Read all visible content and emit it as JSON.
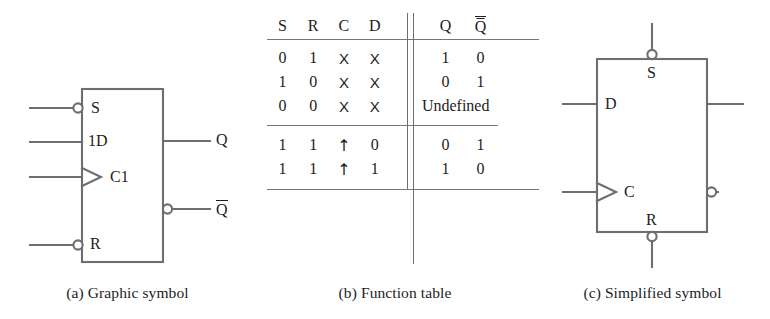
{
  "figure": {
    "stroke_color": "#6e6e6e",
    "text_color": "#1d1d1d",
    "background": "#ffffff"
  },
  "panel_a": {
    "caption": "(a) Graphic symbol",
    "labels": {
      "s": "S",
      "d": "1D",
      "c": "C1",
      "r": "R",
      "q": "Q",
      "qbar": "Q"
    },
    "inputs": [
      "S",
      "1D",
      "C1",
      "R"
    ],
    "outputs": [
      "Q",
      "Q̅"
    ],
    "inverting_pins": [
      "S",
      "R",
      "Q̅"
    ],
    "clock_pin": "C1"
  },
  "panel_b": {
    "caption": "(b) Function table",
    "table": {
      "input_headers": [
        "S",
        "R",
        "C",
        "D"
      ],
      "output_headers": [
        "Q",
        "Q̅"
      ],
      "groups": [
        {
          "rows": [
            {
              "inputs": [
                "0",
                "1",
                "X",
                "X"
              ],
              "outputs": [
                "1",
                "0"
              ],
              "note": ""
            },
            {
              "inputs": [
                "1",
                "0",
                "X",
                "X"
              ],
              "outputs": [
                "0",
                "1"
              ],
              "note": ""
            },
            {
              "inputs": [
                "0",
                "0",
                "X",
                "X"
              ],
              "outputs": [],
              "note": "Undefined"
            }
          ]
        },
        {
          "rows": [
            {
              "inputs": [
                "1",
                "1",
                "↑",
                "0"
              ],
              "outputs": [
                "0",
                "1"
              ],
              "note": ""
            },
            {
              "inputs": [
                "1",
                "1",
                "↑",
                "1"
              ],
              "outputs": [
                "1",
                "0"
              ],
              "note": ""
            }
          ]
        }
      ]
    }
  },
  "panel_c": {
    "caption": "(c) Simplified symbol",
    "labels": {
      "s": "S",
      "d": "D",
      "c": "C",
      "r": "R"
    },
    "inputs": [
      "S",
      "D",
      "C",
      "R"
    ],
    "inverting_pins": [
      "S",
      "R",
      "lower-right-output"
    ]
  }
}
